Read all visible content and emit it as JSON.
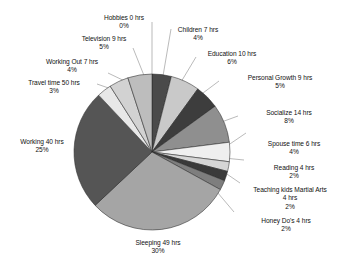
{
  "chart_data": {
    "type": "pie",
    "title": "",
    "subtitle": "",
    "xlabel": "",
    "ylabel": "",
    "legend_position": "none",
    "grid": false,
    "unit": "hrs",
    "value_suffix": " hrs",
    "categories": [
      "Children",
      "Education",
      "Personal Growth",
      "Socialize",
      "Spouse time",
      "Reading",
      "Teaching kids Martial Arts",
      "Honey Do's",
      "Sleeping",
      "Working",
      "Travel time",
      "Working Out",
      "Television",
      "Hobbies"
    ],
    "values": [
      7,
      10,
      9,
      14,
      6,
      4,
      4,
      4,
      49,
      40,
      50,
      7,
      9,
      0
    ],
    "percents": [
      4,
      6,
      5,
      8,
      4,
      2,
      2,
      2,
      30,
      25,
      3,
      4,
      5,
      0
    ],
    "slice_colors": [
      "#4a4a4a",
      "#c9c9c9",
      "#3d3d3d",
      "#8f8f8f",
      "#efefef",
      "#d6d6d6",
      "#3a3a3a",
      "#7e7e7e",
      "#a5a5a5",
      "#555555",
      "#e8e8e8",
      "#d2d2d2",
      "#bdbdbd",
      "#ffffff"
    ],
    "slices": [
      {
        "label": "Children 7 hrs",
        "percent_label": "4%",
        "name": "Children",
        "value": 7,
        "percent": 4
      },
      {
        "label": "Education 10 hrs",
        "percent_label": "6%",
        "name": "Education",
        "value": 10,
        "percent": 6
      },
      {
        "label": "Personal Growth 9 hrs",
        "percent_label": "5%",
        "name": "Personal Growth",
        "value": 9,
        "percent": 5
      },
      {
        "label": "Socialize 14 hrs",
        "percent_label": "8%",
        "name": "Socialize",
        "value": 14,
        "percent": 8
      },
      {
        "label": "Spouse time 6 hrs",
        "percent_label": "4%",
        "name": "Spouse time",
        "value": 6,
        "percent": 4
      },
      {
        "label": "Reading 4 hrs",
        "percent_label": "2%",
        "name": "Reading",
        "value": 4,
        "percent": 2
      },
      {
        "label": "Teaching kids Martial Arts",
        "label2": "4 hrs",
        "percent_label": "2%",
        "name": "Teaching kids Martial Arts",
        "value": 4,
        "percent": 2
      },
      {
        "label": "Honey Do's 4 hrs",
        "percent_label": "2%",
        "name": "Honey Do's",
        "value": 4,
        "percent": 2
      },
      {
        "label": "Sleeping 49 hrs",
        "percent_label": "30%",
        "name": "Sleeping",
        "value": 49,
        "percent": 30
      },
      {
        "label": "Working 40 hrs",
        "percent_label": "25%",
        "name": "Working",
        "value": 40,
        "percent": 25
      },
      {
        "label": "Travel time 50 hrs",
        "percent_label": "3%",
        "name": "Travel time",
        "value": 50,
        "percent": 3
      },
      {
        "label": "Working Out 7 hrs",
        "percent_label": "4%",
        "name": "Working Out",
        "value": 7,
        "percent": 4
      },
      {
        "label": "Television 9 hrs",
        "percent_label": "5%",
        "name": "Television",
        "value": 9,
        "percent": 5
      },
      {
        "label": "Hobbies 0 hrs",
        "percent_label": "0%",
        "name": "Hobbies",
        "value": 0,
        "percent": 0
      }
    ]
  },
  "labels": {
    "hobbies": {
      "l1": "Hobbies 0 hrs",
      "l2": "0%"
    },
    "television": {
      "l1": "Television 9 hrs",
      "l2": "5%"
    },
    "working_out": {
      "l1": "Working Out 7 hrs",
      "l2": "4%"
    },
    "travel_time": {
      "l1": "Travel time 50 hrs",
      "l2": "3%"
    },
    "working": {
      "l1": "Working 40 hrs",
      "l2": "25%"
    },
    "sleeping": {
      "l1": "Sleeping 49 hrs",
      "l2": "30%"
    },
    "children": {
      "l1": "Children 7 hrs",
      "l2": "4%"
    },
    "education": {
      "l1": "Education 10 hrs",
      "l2": "6%"
    },
    "personal_growth": {
      "l1": "Personal Growth 9 hrs",
      "l2": "5%"
    },
    "socialize": {
      "l1": "Socialize 14 hrs",
      "l2": "8%"
    },
    "spouse_time": {
      "l1": "Spouse time 6 hrs",
      "l2": "4%"
    },
    "reading": {
      "l1": "Reading 4 hrs",
      "l2": "2%"
    },
    "teaching_kids": {
      "l1": "Teaching kids Martial Arts",
      "l2": "4 hrs",
      "l3": "2%"
    },
    "honey_dos": {
      "l1": "Honey Do's 4 hrs",
      "l2": "2%"
    }
  },
  "style": {
    "background": "#ffffff",
    "text_color": "#111111",
    "leader_line_color": "#8c8c8c",
    "slice_outline": "#2b2b2b"
  }
}
